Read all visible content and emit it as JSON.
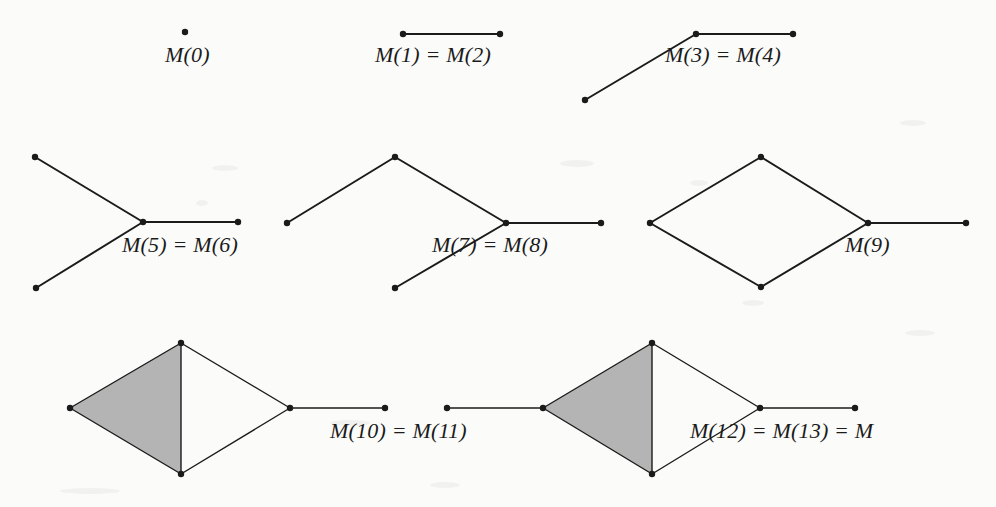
{
  "page": {
    "width": 996,
    "height": 507,
    "background_color": "#fbfbfa",
    "ink_color": "#1b1b1b",
    "shade_color": "#b4b4b4"
  },
  "labels": {
    "m0": "M(0)",
    "m1_m2": "M(1) = M(2)",
    "m3_m4": "M(3) = M(4)",
    "m5_m6": "M(5) = M(6)",
    "m7_m8": "M(7) = M(8)",
    "m9": "M(9)",
    "m10_m11": "M(10) = M(11)",
    "m12_m13_m": "M(12) = M(13) = M"
  },
  "chart_data": {
    "type": "diagram",
    "title": "",
    "figures": [
      {
        "id": "m0",
        "label": "M(0)",
        "label_pos": [
          165,
          52
        ],
        "vertices": [
          [
            185,
            32
          ]
        ],
        "edges": [],
        "shaded_faces": []
      },
      {
        "id": "m1_m2",
        "label": "M(1) = M(2)",
        "label_pos": [
          387,
          52
        ],
        "vertices": [
          [
            403,
            34
          ],
          [
            500,
            34
          ]
        ],
        "edges": [
          [
            0,
            1
          ]
        ],
        "shaded_faces": []
      },
      {
        "id": "m3_m4",
        "label": "M(3) = M(4)",
        "label_pos": [
          673,
          52
        ],
        "vertices": [
          [
            585,
            100
          ],
          [
            696,
            34
          ],
          [
            793,
            34
          ]
        ],
        "edges": [
          [
            0,
            1
          ],
          [
            1,
            2
          ]
        ],
        "shaded_faces": []
      },
      {
        "id": "m5_m6",
        "label": "M(5) = M(6)",
        "label_pos": [
          128,
          240
        ],
        "vertices": [
          [
            35,
            157
          ],
          [
            36,
            288
          ],
          [
            143,
            222
          ],
          [
            238,
            222
          ]
        ],
        "edges": [
          [
            0,
            2
          ],
          [
            1,
            2
          ],
          [
            2,
            3
          ]
        ],
        "shaded_faces": []
      },
      {
        "id": "m7_m8",
        "label": "M(7) = M(8)",
        "label_pos": [
          440,
          240
        ],
        "vertices": [
          [
            287,
            223
          ],
          [
            395,
            157
          ],
          [
            506,
            223
          ],
          [
            395,
            288
          ],
          [
            601,
            223
          ]
        ],
        "edges": [
          [
            0,
            1
          ],
          [
            1,
            2
          ],
          [
            2,
            3
          ],
          [
            2,
            4
          ]
        ],
        "shaded_faces": []
      },
      {
        "id": "m9",
        "label": "M(9)",
        "label_pos": [
          860,
          240
        ],
        "vertices": [
          [
            650,
            223
          ],
          [
            761,
            157
          ],
          [
            868,
            223
          ],
          [
            761,
            287
          ],
          [
            966,
            223
          ]
        ],
        "edges": [
          [
            0,
            1
          ],
          [
            1,
            2
          ],
          [
            2,
            3
          ],
          [
            3,
            0
          ],
          [
            2,
            4
          ]
        ],
        "shaded_faces": []
      },
      {
        "id": "m10_m11",
        "label": "M(10) = M(11)",
        "label_pos": [
          236,
          425
        ],
        "vertices": [
          [
            70,
            408
          ],
          [
            181,
            343
          ],
          [
            181,
            474
          ],
          [
            290,
            408
          ],
          [
            385,
            408
          ]
        ],
        "edges": [
          [
            0,
            1
          ],
          [
            0,
            2
          ],
          [
            1,
            2
          ],
          [
            1,
            3
          ],
          [
            2,
            3
          ],
          [
            3,
            4
          ]
        ],
        "shaded_faces": [
          [
            0,
            1,
            2
          ]
        ]
      },
      {
        "id": "m12_m13_m",
        "label": "M(12) = M(13) = M",
        "label_pos": [
          690,
          425
        ],
        "vertices": [
          [
            447,
            408
          ],
          [
            543,
            408
          ],
          [
            652,
            343
          ],
          [
            652,
            474
          ],
          [
            760,
            408
          ],
          [
            855,
            408
          ]
        ],
        "edges": [
          [
            0,
            1
          ],
          [
            1,
            2
          ],
          [
            1,
            3
          ],
          [
            2,
            3
          ],
          [
            2,
            4
          ],
          [
            3,
            4
          ],
          [
            4,
            5
          ]
        ],
        "shaded_faces": [
          [
            1,
            2,
            3
          ]
        ]
      }
    ],
    "style": {
      "vertex_radius": 3.2,
      "edge_width": 2.0,
      "thin_edge_width": 1.4
    }
  }
}
